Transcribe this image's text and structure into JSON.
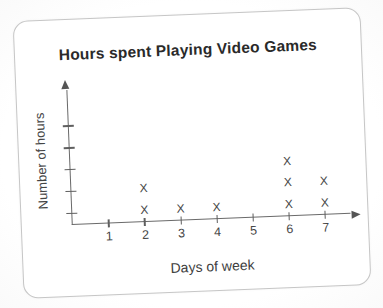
{
  "chart_data": {
    "type": "scatter",
    "title": "Hours spent Playing Video Games",
    "xlabel": "Days of week",
    "ylabel": "Number of hours",
    "marker_glyph": "X",
    "x_ticks": [
      1,
      2,
      3,
      4,
      5,
      6,
      7
    ],
    "xlim": [
      0,
      7.7
    ],
    "y_tick_count": 5,
    "y_ticks_labeled": false,
    "y_first_tick_offset_frac": 0.08,
    "y_tick_spacing_frac": 0.163,
    "categories": [
      1,
      2,
      3,
      4,
      5,
      6,
      7
    ],
    "marks_per_day": [
      0,
      2,
      1,
      1,
      0,
      3,
      2
    ],
    "points": [
      {
        "day": 2,
        "level": 1
      },
      {
        "day": 2,
        "level": 2
      },
      {
        "day": 3,
        "level": 1
      },
      {
        "day": 4,
        "level": 1
      },
      {
        "day": 6,
        "level": 1
      },
      {
        "day": 6,
        "level": 2
      },
      {
        "day": 6,
        "level": 3
      },
      {
        "day": 7,
        "level": 1
      },
      {
        "day": 7,
        "level": 2
      }
    ],
    "grid": false,
    "legend_position": "none",
    "axis_color": "#6a6a6a",
    "marker_color": "#474747",
    "title_color": "#2a2a2a"
  }
}
